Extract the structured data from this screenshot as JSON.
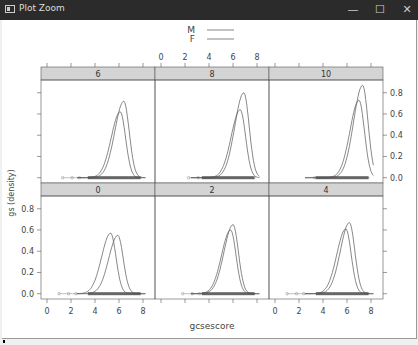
{
  "window": {
    "title": "Plot Zoom",
    "controls": {
      "minimize": "—",
      "maximize": "☐",
      "close": "✕"
    }
  },
  "chart_data": {
    "type": "line",
    "title": "",
    "xlabel": "gcsescore",
    "ylabel": "gs (density)",
    "legend": {
      "position": "top",
      "entries": [
        "M",
        "F"
      ]
    },
    "x_ticks": [
      "0",
      "2",
      "4",
      "6",
      "8"
    ],
    "y_ticks": [
      "0.0",
      "0.2",
      "0.4",
      "0.6",
      "0.8"
    ],
    "xlim": [
      -0.5,
      9
    ],
    "ylim": [
      -0.05,
      0.92
    ],
    "panels": [
      {
        "label": "6",
        "row": 0,
        "col": 0,
        "peaks": {
          "M": {
            "x": 6.4,
            "y": 0.72
          },
          "F": {
            "x": 6.1,
            "y": 0.62
          }
        },
        "rug_min": 1.3
      },
      {
        "label": "8",
        "row": 0,
        "col": 1,
        "peaks": {
          "M": {
            "x": 6.9,
            "y": 0.8
          },
          "F": {
            "x": 6.6,
            "y": 0.64
          }
        },
        "rug_min": 2.3
      },
      {
        "label": "10",
        "row": 0,
        "col": 2,
        "peaks": {
          "M": {
            "x": 7.3,
            "y": 0.87
          },
          "F": {
            "x": 7.0,
            "y": 0.73
          }
        },
        "rug_min": 3.3
      },
      {
        "label": "0",
        "row": 1,
        "col": 0,
        "peaks": {
          "M": {
            "x": 5.9,
            "y": 0.55
          },
          "F": {
            "x": 5.3,
            "y": 0.57
          }
        },
        "rug_min": 1.0
      },
      {
        "label": "2",
        "row": 1,
        "col": 1,
        "peaks": {
          "M": {
            "x": 6.0,
            "y": 0.65
          },
          "F": {
            "x": 5.8,
            "y": 0.6
          }
        },
        "rug_min": 1.8
      },
      {
        "label": "4",
        "row": 1,
        "col": 2,
        "peaks": {
          "M": {
            "x": 6.2,
            "y": 0.67
          },
          "F": {
            "x": 5.9,
            "y": 0.61
          }
        },
        "rug_min": 1.0
      }
    ],
    "grid": false
  }
}
